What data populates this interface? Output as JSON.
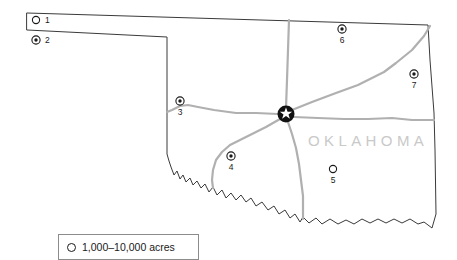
{
  "map": {
    "title": "Oklahoma",
    "state_label": "OKLAHOMA",
    "colors": {
      "border": "#3a3a3a",
      "route": "#b0b0b0",
      "state_label": "#c9c9c9",
      "marker": "#1a1a1a",
      "background": "#ffffff",
      "legend_border": "#8c8c8c"
    },
    "capital": {
      "name": "capital-star",
      "label": "",
      "x": 286,
      "y": 114
    },
    "markers": [
      {
        "id": "1",
        "label": "1",
        "symbol": "open-circle",
        "x": 36,
        "y": 20,
        "label_x": 45,
        "label_y": 23
      },
      {
        "id": "2",
        "label": "2",
        "symbol": "bullseye",
        "x": 36,
        "y": 40,
        "label_x": 45,
        "label_y": 43
      },
      {
        "id": "3",
        "label": "3",
        "symbol": "bullseye",
        "x": 180,
        "y": 101,
        "label_x": 180,
        "label_y": 116
      },
      {
        "id": "4",
        "label": "4",
        "symbol": "bullseye",
        "x": 231,
        "y": 156,
        "label_x": 231,
        "label_y": 171
      },
      {
        "id": "5",
        "label": "5",
        "symbol": "open-circle",
        "x": 333,
        "y": 169,
        "label_x": 333,
        "label_y": 184
      },
      {
        "id": "6",
        "label": "6",
        "symbol": "bullseye",
        "x": 342,
        "y": 29,
        "label_x": 342,
        "label_y": 44
      },
      {
        "id": "7",
        "label": "7",
        "symbol": "bullseye",
        "x": 414,
        "y": 74,
        "label_x": 414,
        "label_y": 89
      }
    ],
    "legend": {
      "symbol": "open-circle",
      "text": "1,000–10,000 acres"
    }
  }
}
